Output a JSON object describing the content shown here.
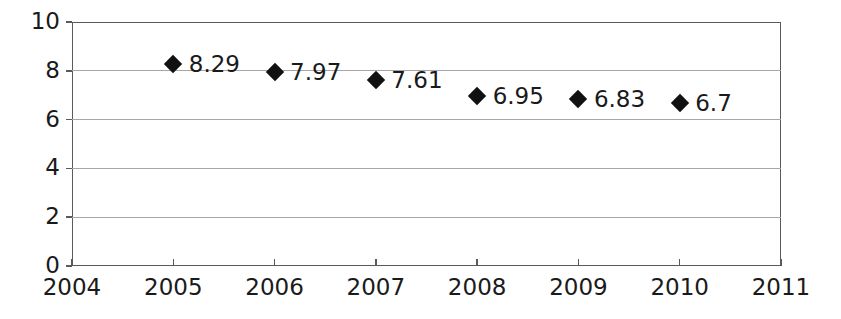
{
  "chart_data": {
    "type": "scatter",
    "title": "",
    "subtitle": "",
    "xlabel": "",
    "ylabel": "",
    "x": [
      2005,
      2006,
      2007,
      2008,
      2009,
      2010
    ],
    "values": [
      8.29,
      7.97,
      7.61,
      6.95,
      6.83,
      6.7
    ],
    "point_labels": [
      "8.29",
      "7.97",
      "7.61",
      "6.95",
      "6.83",
      "6.7"
    ],
    "xlim": [
      2004,
      2011
    ],
    "ylim": [
      0,
      10
    ],
    "xticks": [
      2004,
      2005,
      2006,
      2007,
      2008,
      2009,
      2010,
      2011
    ],
    "xtick_labels": [
      "2004",
      "2005",
      "2006",
      "2007",
      "2008",
      "2009",
      "2010",
      "2011"
    ],
    "yticks": [
      0,
      2,
      4,
      6,
      8,
      10
    ],
    "ytick_labels": [
      "0",
      "2",
      "4",
      "6",
      "8",
      "10"
    ],
    "grid": "horizontal",
    "legend": "none",
    "marker_shape": "diamond",
    "marker_color": "#111111",
    "gridline_color": "#a6a6a6",
    "axis_color": "#5a5a5a",
    "background_color": "#ffffff"
  }
}
